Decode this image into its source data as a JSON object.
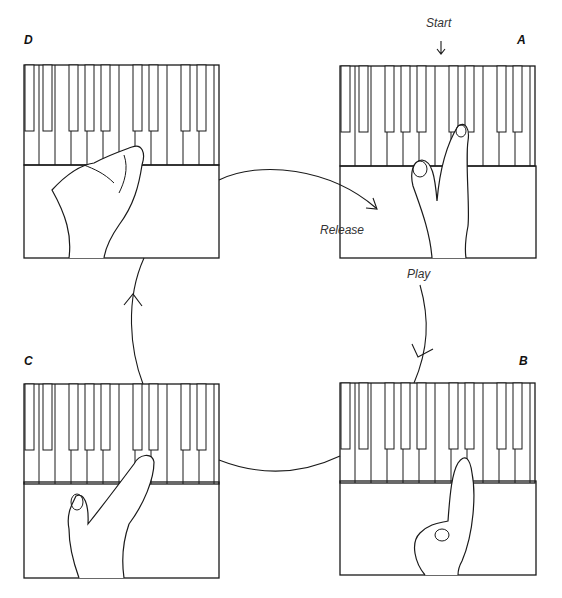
{
  "diagram": {
    "type": "cycle",
    "panels": [
      {
        "id": "A",
        "letter": "A",
        "position": "top-right",
        "description": "hand raised, fingers above keys"
      },
      {
        "id": "B",
        "letter": "B",
        "position": "bottom-right",
        "description": "finger pressing key"
      },
      {
        "id": "C",
        "letter": "C",
        "position": "bottom-left",
        "description": "hand relaxing after key press"
      },
      {
        "id": "D",
        "letter": "D",
        "position": "top-left",
        "description": "hand resting over keys"
      }
    ],
    "labels": {
      "start": "Start",
      "play": "Play",
      "release": "Release"
    },
    "arrows": [
      {
        "from": "A",
        "to": "B",
        "label": "Play"
      },
      {
        "from": "B",
        "to": "C",
        "label": ""
      },
      {
        "from": "C",
        "to": "D",
        "label": ""
      },
      {
        "from": "D",
        "to": "A",
        "label": "Release"
      }
    ],
    "colors": {
      "stroke": "#1a1a1a",
      "background": "#ffffff"
    }
  }
}
